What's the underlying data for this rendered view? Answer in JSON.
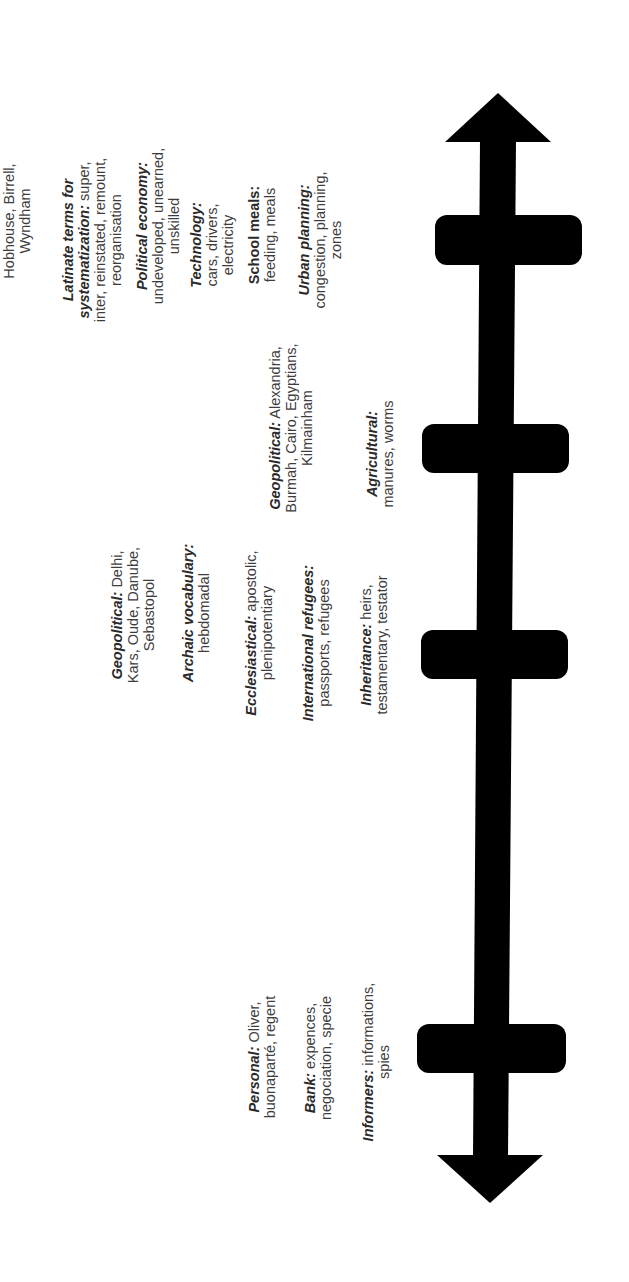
{
  "diagram": {
    "type": "timeline",
    "orientation": "rotated-90-ccw",
    "axis_color": "#000000",
    "text_color": "#3d3d3d",
    "periods": [
      {
        "id": "period-1",
        "notes": [
          {
            "label": "Personal:",
            "body": "Oliver, buonaparté, regent"
          },
          {
            "label": "Bank:",
            "body": "expences, negociation, specie"
          },
          {
            "label": "Informers:",
            "body": "informations, spies"
          }
        ]
      },
      {
        "id": "period-2",
        "notes": [
          {
            "label": "Geopolitical:",
            "body": "Delhi, Kars, Oude, Danube, Sebastopol"
          },
          {
            "label": "Archaic vocabulary:",
            "body": "hebdomadal"
          },
          {
            "label": "Ecclesiastical:",
            "body": "apostolic, plenipotentiary"
          },
          {
            "label": "International refugees:",
            "body": "passports, refugees"
          },
          {
            "label": "Inheritance:",
            "body": "heirs, testamentary, testator"
          }
        ]
      },
      {
        "id": "period-3",
        "notes": [
          {
            "label": "Geopolitical:",
            "body": "Alexandria, Burmah, Cairo, Egyptians, Kilmainham"
          },
          {
            "label": "Agricultural:",
            "body": "manures, worms"
          }
        ]
      },
      {
        "id": "period-4",
        "notes": [
          {
            "label": "",
            "body": "Hobhouse, Birrell, Wyndham"
          },
          {
            "label": "Latinate terms for systematization:",
            "body": "super, inter, reinstated, remount, reorganisation"
          },
          {
            "label": "Political economy:",
            "body": "undeveloped, unearned, unskilled"
          },
          {
            "label": "Technology:",
            "body": "cars, drivers, electricity"
          },
          {
            "label": "School meals:",
            "body": "feeding, meals"
          },
          {
            "label": "Urban planning:",
            "body": "congestion, planning, zones"
          }
        ]
      }
    ]
  }
}
